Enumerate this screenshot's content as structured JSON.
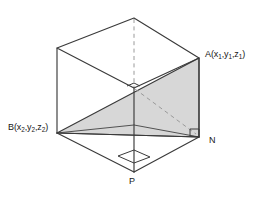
{
  "figure": {
    "type": "3d-geometry-diagram",
    "background_color": "#ffffff",
    "line_color": "#3a3a3a",
    "hidden_line_color": "#9a9a9a",
    "shade_color": "#d7d7d7",
    "labels": {
      "a": {
        "base": "A(x",
        "sub1": "1",
        "mid1": ",y",
        "sub2": "1",
        "mid2": ",z",
        "sub3": "1",
        "close": ")"
      },
      "b": {
        "base": "B(x",
        "sub1": "2",
        "mid1": ",y",
        "sub2": "2",
        "mid2": ",z",
        "sub3": "2",
        "close": ")"
      },
      "n": "N",
      "p": "P"
    },
    "vertices": {
      "top_back_apex": [
        134,
        18
      ],
      "top_left": [
        57,
        48
      ],
      "top_right_A": [
        199,
        58
      ],
      "top_front_inner": [
        134,
        88
      ],
      "bottom_left_B": [
        57,
        133
      ],
      "bottom_right_N": [
        199,
        137
      ],
      "bottom_front_P": [
        134,
        172
      ],
      "bottom_back_hidden": [
        134,
        125
      ]
    },
    "shaded_triangle": {
      "name": "triangle-ABN",
      "points": "57,133 199,58 199,137",
      "fill": "#d7d7d7"
    },
    "right_angles": [
      {
        "at": "N",
        "name": "right-angle-at-n"
      },
      {
        "at": "P",
        "name": "right-angle-at-p"
      },
      {
        "at": "inner-vertex",
        "name": "right-angle-inner"
      }
    ],
    "dashed_segments": [
      {
        "name": "vertical-hidden-edge",
        "from": [
          134,
          18
        ],
        "to": [
          134,
          88
        ]
      },
      {
        "name": "diagonal-hidden-PN",
        "from": [
          134,
          88
        ],
        "to": [
          196,
          134
        ]
      }
    ]
  }
}
